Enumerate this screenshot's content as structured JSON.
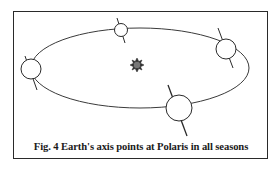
{
  "figure": {
    "caption": "Fig. 4 Earth's axis points at Polaris in all seasons",
    "elements": {
      "orbit": "elliptical-orbit",
      "sun": "sun-icon",
      "earths": [
        "earth-left",
        "earth-top",
        "earth-right",
        "earth-bottom"
      ]
    },
    "colors": {
      "frame": "#2a2a2a",
      "orbit": "#3a3a3a",
      "sun": "#555555"
    }
  }
}
